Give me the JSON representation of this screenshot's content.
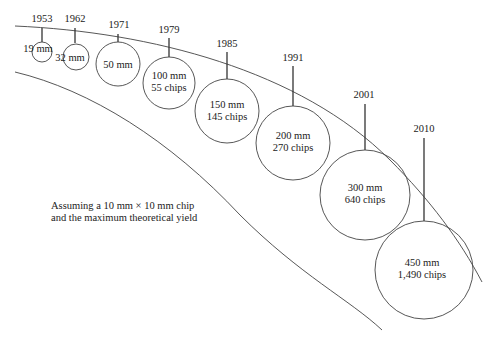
{
  "note": {
    "line1": "Assuming a 10 mm × 10 mm chip",
    "line2": "and the maximum theoretical yield"
  },
  "wafers": [
    {
      "year": "1953",
      "size": "19 mm",
      "chips": ""
    },
    {
      "year": "1962",
      "size": "32 mm",
      "chips": ""
    },
    {
      "year": "1971",
      "size": "50 mm",
      "chips": ""
    },
    {
      "year": "1979",
      "size": "100 mm",
      "chips": "55 chips"
    },
    {
      "year": "1985",
      "size": "150 mm",
      "chips": "145 chips"
    },
    {
      "year": "1991",
      "size": "200 mm",
      "chips": "270 chips"
    },
    {
      "year": "2001",
      "size": "300 mm",
      "chips": "640 chips"
    },
    {
      "year": "2010",
      "size": "450 mm",
      "chips": "1,490 chips"
    }
  ],
  "colors": {
    "stroke": "#333333",
    "text": "#222222",
    "background": "#ffffff"
  }
}
